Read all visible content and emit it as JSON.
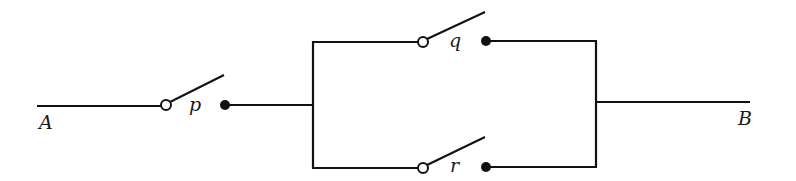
{
  "diagram": {
    "type": "switching-circuit",
    "terminals": {
      "start": "A",
      "end": "B"
    },
    "switches": [
      {
        "id": "p",
        "label": "p",
        "state": "open",
        "connection": "series"
      },
      {
        "id": "q",
        "label": "q",
        "state": "open",
        "connection": "parallel-top"
      },
      {
        "id": "r",
        "label": "r",
        "state": "open",
        "connection": "parallel-bottom"
      }
    ],
    "colors": {
      "wire": "#111111",
      "background": "#ffffff"
    }
  }
}
